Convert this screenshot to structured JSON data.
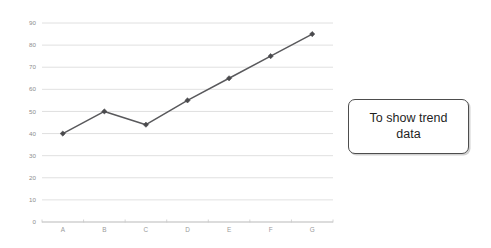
{
  "callout": {
    "text": "To show trend\ndata"
  },
  "chart_data": {
    "type": "line",
    "title": "",
    "subtitle": "",
    "xlabel": "",
    "ylabel": "",
    "categories": [
      "A",
      "B",
      "C",
      "D",
      "E",
      "F",
      "G"
    ],
    "values": [
      40,
      50,
      44,
      55,
      65,
      75,
      85
    ],
    "series": [
      {
        "name": "Trend",
        "values": [
          40,
          50,
          44,
          55,
          65,
          75,
          85
        ]
      }
    ],
    "ylim": [
      0,
      90
    ],
    "ytick_labels": [
      "0",
      "10",
      "20",
      "30",
      "40",
      "50",
      "60",
      "70",
      "80",
      "90"
    ],
    "ytick_values": [
      0,
      10,
      20,
      30,
      40,
      50,
      60,
      70,
      80,
      90
    ],
    "xtick_labels": [
      "A",
      "B",
      "C",
      "D",
      "E",
      "F",
      "G"
    ],
    "grid": true,
    "grid_axis": "y",
    "legend": false,
    "legend_position": "none",
    "marker": "diamond",
    "colors": {
      "line": "#59595c",
      "marker": "#4a4a4d",
      "gridline": "#d8d8d8",
      "axis": "#b9b9b9",
      "tick_label": "#8d8d8d",
      "background": "#ffffff"
    }
  }
}
